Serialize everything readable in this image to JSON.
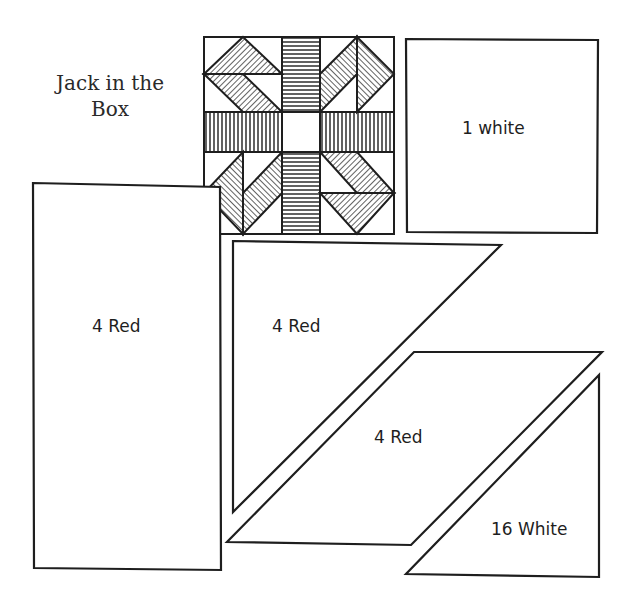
{
  "title": {
    "line1": "Jack in the",
    "line2": "Box"
  },
  "colors": {
    "ink": "#1e1e1e",
    "paper": "#ffffff"
  },
  "block": {
    "name": "Jack in the Box quilt block",
    "x": 204,
    "y": 37,
    "size": 190
  },
  "pieces": [
    {
      "id": "center-square",
      "label": "1 white",
      "shape": "square",
      "points": [
        [
          406,
          39
        ],
        [
          598,
          40
        ],
        [
          597,
          233
        ],
        [
          407,
          232
        ]
      ],
      "label_pos": [
        462,
        118
      ]
    },
    {
      "id": "strip",
      "label": "4 Red",
      "shape": "rectangle",
      "points": [
        [
          33,
          183
        ],
        [
          220,
          187
        ],
        [
          221,
          570
        ],
        [
          34,
          568
        ]
      ],
      "label_pos": [
        92,
        316
      ]
    },
    {
      "id": "large-triangle",
      "label": "4 Red",
      "shape": "triangle",
      "points": [
        [
          233,
          241
        ],
        [
          501,
          245
        ],
        [
          233,
          512
        ]
      ],
      "label_pos": [
        272,
        316
      ]
    },
    {
      "id": "parallelogram",
      "label": "4 Red",
      "shape": "parallelogram",
      "points": [
        [
          414,
          352
        ],
        [
          602,
          352
        ],
        [
          411,
          545
        ],
        [
          227,
          542
        ]
      ],
      "label_pos": [
        374,
        427
      ]
    },
    {
      "id": "small-triangle",
      "label": "16 White",
      "shape": "triangle",
      "points": [
        [
          599,
          375
        ],
        [
          599,
          577
        ],
        [
          406,
          574
        ]
      ],
      "label_pos": [
        491,
        519
      ]
    }
  ]
}
